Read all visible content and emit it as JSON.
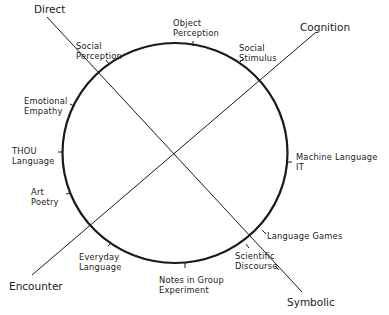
{
  "diagram": {
    "poles": {
      "direct": "Direct",
      "cognition": "Cognition",
      "encounter": "Encounter",
      "symbolic": "Symbolic"
    },
    "labels": {
      "object_perception": [
        "Object",
        "Perception"
      ],
      "social_perception": [
        "Social",
        "Perception"
      ],
      "social_stimulus": [
        "Social",
        "Stimulus"
      ],
      "emotional_empathy": [
        "Emotional",
        "Empathy"
      ],
      "thou_language": [
        "THOU",
        "Language"
      ],
      "machine_language": [
        "Machine Language",
        "IT"
      ],
      "art_poetry": [
        "Art",
        "Poetry"
      ],
      "language_games": [
        "Language Games"
      ],
      "scientific_discourse": [
        "Scientific",
        "Discourse"
      ],
      "everyday_language": [
        "Everyday",
        "Language"
      ],
      "notes_in_group": [
        "Notes in Group",
        "Experiment"
      ]
    },
    "colors": {
      "stroke": "#1a1a1a",
      "background": "#ffffff"
    }
  }
}
